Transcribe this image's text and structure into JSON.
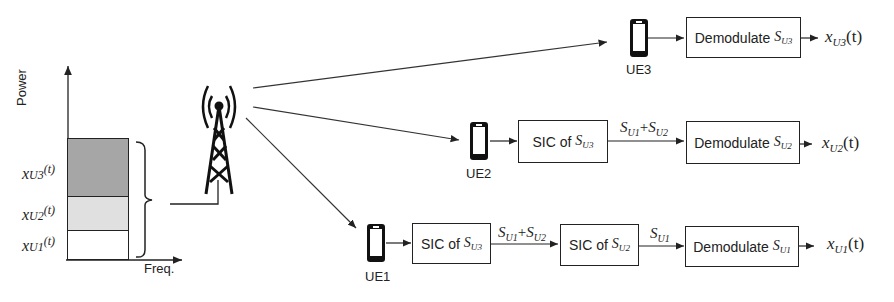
{
  "spectrum": {
    "y_axis_label": "Power",
    "x_axis_label": "Freq.",
    "bands": [
      {
        "id": "U3",
        "label_base": "x",
        "label_sub": "U3",
        "label_arg": "(t)",
        "fill": "#a6a6a6"
      },
      {
        "id": "U2",
        "label_base": "x",
        "label_sub": "U2",
        "label_arg": "(t)",
        "fill": "#e0e0e0"
      },
      {
        "id": "U1",
        "label_base": "x",
        "label_sub": "U1",
        "label_arg": "(t)",
        "fill": "#ffffff"
      }
    ]
  },
  "transmitter": {
    "icon": "cell-tower-icon"
  },
  "receivers": {
    "ue3": {
      "label": "UE3",
      "demod": {
        "text": "Demodulate ",
        "sym": "S",
        "sub": "U3"
      },
      "output": {
        "base": "x",
        "sub": "U3",
        "arg": "(t)"
      }
    },
    "ue2": {
      "label": "UE2",
      "sic1": {
        "text": "SIC of ",
        "sym": "S",
        "sub": "U3"
      },
      "mid_signal": {
        "a": "S",
        "a_sub": "U1",
        "plus": "+",
        "b": "S",
        "b_sub": "U2"
      },
      "demod": {
        "text": "Demodulate ",
        "sym": "S",
        "sub": "U2"
      },
      "output": {
        "base": "x",
        "sub": "U2",
        "arg": "(t)"
      }
    },
    "ue1": {
      "label": "UE1",
      "sic1": {
        "text": "SIC of ",
        "sym": "S",
        "sub": "U3"
      },
      "mid_signal_1": {
        "a": "S",
        "a_sub": "U1",
        "plus": "+",
        "b": "S",
        "b_sub": "U2"
      },
      "sic2": {
        "text": "SIC of ",
        "sym": "S",
        "sub": "U2"
      },
      "mid_signal_2": {
        "a": "S",
        "a_sub": "U1"
      },
      "demod": {
        "text": "Demodulate ",
        "sym": "S",
        "sub": "U1"
      },
      "output": {
        "base": "x",
        "sub": "U1",
        "arg": "(t)"
      }
    }
  }
}
